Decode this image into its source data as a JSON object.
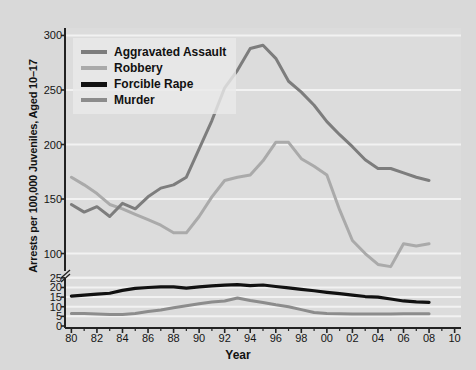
{
  "chart_data": {
    "type": "line",
    "title": "",
    "xlabel": "Year",
    "ylabel": "Arrests per 100,000 Juveniles, Aged 10–17",
    "grid": true,
    "legend_position": "top-left",
    "axis_break": true,
    "x": [
      1980,
      1981,
      1982,
      1983,
      1984,
      1985,
      1986,
      1987,
      1988,
      1989,
      1990,
      1991,
      1992,
      1993,
      1994,
      1995,
      1996,
      1997,
      1998,
      1999,
      2000,
      2001,
      2002,
      2003,
      2004,
      2005,
      2006,
      2007,
      2008
    ],
    "xtick_labels": [
      "80",
      "82",
      "84",
      "86",
      "88",
      "90",
      "92",
      "94",
      "96",
      "98",
      "00",
      "02",
      "04",
      "06",
      "08",
      "10"
    ],
    "xtick_values": [
      1980,
      1982,
      1984,
      1986,
      1988,
      1990,
      1992,
      1994,
      1996,
      1998,
      2000,
      2002,
      2004,
      2006,
      2008,
      2010
    ],
    "xlim": [
      1979.5,
      2010.5
    ],
    "ytick_labels_upper": [
      "300",
      "250",
      "200",
      "150",
      "100"
    ],
    "ytick_values_upper": [
      300,
      250,
      200,
      150,
      100
    ],
    "ytick_labels_lower": [
      "25",
      "20",
      "15",
      "10",
      "5",
      "0"
    ],
    "ytick_values_lower": [
      25,
      20,
      15,
      10,
      5,
      0
    ],
    "ylim_upper": [
      95,
      305
    ],
    "ylim_lower": [
      0,
      27
    ],
    "series": [
      {
        "name": "Aggravated Assault",
        "color": "#7d7d7d",
        "scale": "upper",
        "values": [
          145,
          138,
          143,
          134,
          146,
          141,
          152,
          160,
          163,
          170,
          196,
          222,
          252,
          268,
          288,
          291,
          279,
          258,
          248,
          236,
          221,
          209,
          198,
          186,
          178,
          178,
          174,
          170,
          167
        ]
      },
      {
        "name": "Robbery",
        "color": "#aaaaaa",
        "scale": "upper",
        "values": [
          170,
          163,
          155,
          145,
          141,
          136,
          131,
          126,
          119,
          119,
          134,
          152,
          167,
          170,
          172,
          185,
          202,
          202,
          187,
          180,
          172,
          140,
          112,
          100,
          90,
          88,
          109,
          107,
          109
        ]
      },
      {
        "name": "Forcible Rape",
        "color": "#111111",
        "scale": "lower",
        "values": [
          15.5,
          16.0,
          16.5,
          17.0,
          18.5,
          19.5,
          20.0,
          20.3,
          20.3,
          19.7,
          20.3,
          20.8,
          21.2,
          21.5,
          21.0,
          21.3,
          20.5,
          19.8,
          19.0,
          18.3,
          17.5,
          16.8,
          16.0,
          15.3,
          15.0,
          14.0,
          13.0,
          12.5,
          12.3
        ]
      },
      {
        "name": "Murder",
        "color": "#8c8c8c",
        "scale": "lower",
        "values": [
          6.5,
          6.5,
          6.2,
          6.0,
          6.0,
          6.5,
          7.5,
          8.3,
          9.5,
          10.5,
          11.5,
          12.5,
          13.0,
          14.5,
          13.2,
          12.2,
          11.0,
          10.0,
          8.5,
          7.0,
          6.5,
          6.3,
          6.2,
          6.2,
          6.2,
          6.2,
          6.3,
          6.3,
          6.3
        ]
      }
    ]
  },
  "legend": {
    "items": [
      {
        "label": "Aggravated Assault"
      },
      {
        "label": "Robbery"
      },
      {
        "label": "Forcible Rape"
      },
      {
        "label": "Murder"
      }
    ]
  },
  "colors": {
    "page_background": "#d9d9d9",
    "plot_background": "#dcdcdc",
    "gridline": "#f2f2f2",
    "axis": "#222222",
    "text": "#111111"
  }
}
